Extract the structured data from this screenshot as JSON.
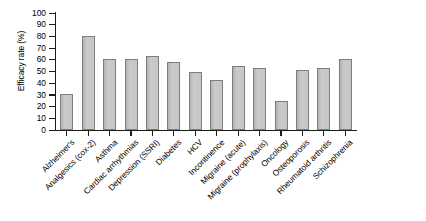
{
  "chart_data": {
    "type": "bar",
    "title": "",
    "xlabel": "",
    "ylabel": "Efficacy rate (%)",
    "ylim": [
      0,
      100
    ],
    "grid": false,
    "legend": "none",
    "ytick_labels": [
      "100",
      "90",
      "80",
      "70",
      "60",
      "50",
      "40",
      "30",
      "20",
      "10",
      "0"
    ],
    "yticks": [
      100,
      90,
      80,
      70,
      60,
      50,
      40,
      30,
      20,
      10,
      0
    ],
    "categories": [
      "Alzheimer's",
      "Analgesics (cox-2)",
      "Asthma",
      "Cardiac arrhythmias",
      "Depression (SSRI)",
      "Diabetes",
      "HCV",
      "Incontinence",
      "Migraine (acute)",
      "Migraine (prophylaxis)",
      "Oncology",
      "Osteoporosis",
      "Rheumatoid arthritis",
      "Schizophrenia"
    ],
    "values": [
      31,
      80,
      61,
      61,
      63,
      58,
      50,
      43,
      55,
      53,
      25,
      51,
      53,
      61
    ],
    "colors": {
      "bar_fill": "#c3c3c3",
      "bar_stroke": "#7d7d7d",
      "axis": "#1c1c1c",
      "background": "#ffffff"
    }
  }
}
